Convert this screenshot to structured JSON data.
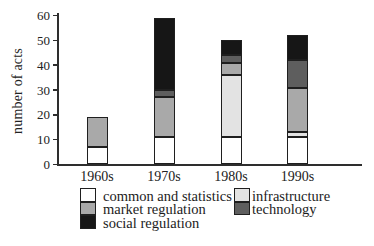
{
  "chart_data": {
    "type": "bar",
    "stacked": true,
    "title": "",
    "xlabel": "",
    "ylabel": "number of acts",
    "ylim": [
      0,
      60
    ],
    "y_ticks": [
      0,
      10,
      20,
      30,
      40,
      50,
      60
    ],
    "grid": false,
    "legend_position": "bottom",
    "categories": [
      "1960s",
      "1970s",
      "1980s",
      "1990s"
    ],
    "series": [
      {
        "name": "common and statistics",
        "color": "#ffffff",
        "values": [
          7,
          11,
          11,
          11
        ]
      },
      {
        "name": "infrastructure",
        "color": "#e3e3e3",
        "values": [
          0,
          0,
          25,
          2
        ]
      },
      {
        "name": "market regulation",
        "color": "#a9a9a9",
        "values": [
          12,
          16,
          5,
          18
        ]
      },
      {
        "name": "technology",
        "color": "#5e5e5e",
        "values": [
          0,
          3,
          3,
          11
        ]
      },
      {
        "name": "social regulation",
        "color": "#161616",
        "values": [
          0,
          29,
          6,
          10
        ]
      }
    ],
    "totals": [
      19,
      59,
      50,
      52
    ],
    "legend_columns": [
      [
        "common and statistics",
        "market regulation",
        "social regulation"
      ],
      [
        "infrastructure",
        "technology"
      ]
    ]
  }
}
